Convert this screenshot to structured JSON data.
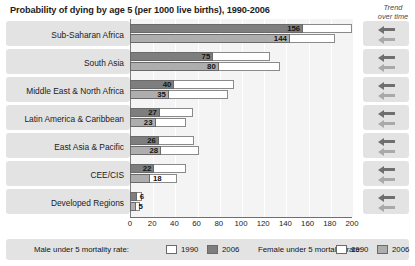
{
  "header": {
    "title": "Probability of dying by age 5 (per 1000 live births), 1990-2006",
    "trend_label_line1": "Trend",
    "trend_label_line2": "over time"
  },
  "legend": {
    "male_label": "Male under 5 mortality rate:",
    "female_label": "Female under 5 mortality rate:",
    "year_1990": "1990",
    "year_2006": "2006"
  },
  "colors": {
    "male_2006": "#7e7e7e",
    "female_2006": "#aeaeae",
    "bar_1990": "#ffffff",
    "plot_background": "#f4f4f4",
    "row_band": "#e3e3e3"
  },
  "chart_data": {
    "type": "bar",
    "title": "Probability of dying by age 5 (per 1000 live births), 1990-2006",
    "xlabel": "",
    "ylabel": "",
    "xlim": [
      0,
      200
    ],
    "xticks": [
      "0",
      "20",
      "40",
      "60",
      "80",
      "100",
      "120",
      "140",
      "160",
      "180",
      "200"
    ],
    "grid": true,
    "legend_position": "bottom",
    "orientation": "horizontal",
    "categories": [
      "Sub-Saharan Africa",
      "South Asia",
      "Middle East & North Africa",
      "Latin America & Caribbean",
      "East Asia & Pacific",
      "CEE/CIS",
      "Developed Regions"
    ],
    "series": [
      {
        "name": "Male under 5 mortality rate: 1990",
        "values": [
          200,
          126,
          94,
          57,
          58,
          50,
          11
        ]
      },
      {
        "name": "Male under 5 mortality rate: 2006",
        "values": [
          156,
          75,
          40,
          27,
          26,
          22,
          6
        ]
      },
      {
        "name": "Female under 5 mortality rate: 1990",
        "values": [
          185,
          135,
          88,
          50,
          62,
          42,
          9
        ]
      },
      {
        "name": "Female under 5 mortality rate: 2006",
        "values": [
          144,
          80,
          35,
          23,
          28,
          18,
          5
        ]
      }
    ],
    "data_labels": {
      "male_2006": [
        "156",
        "75",
        "40",
        "27",
        "26",
        "22",
        "6"
      ],
      "female_2006": [
        "144",
        "80",
        "35",
        "23",
        "28",
        "18",
        "5"
      ]
    },
    "trend": [
      "decreasing",
      "decreasing",
      "decreasing",
      "decreasing",
      "decreasing",
      "decreasing",
      "decreasing"
    ]
  }
}
